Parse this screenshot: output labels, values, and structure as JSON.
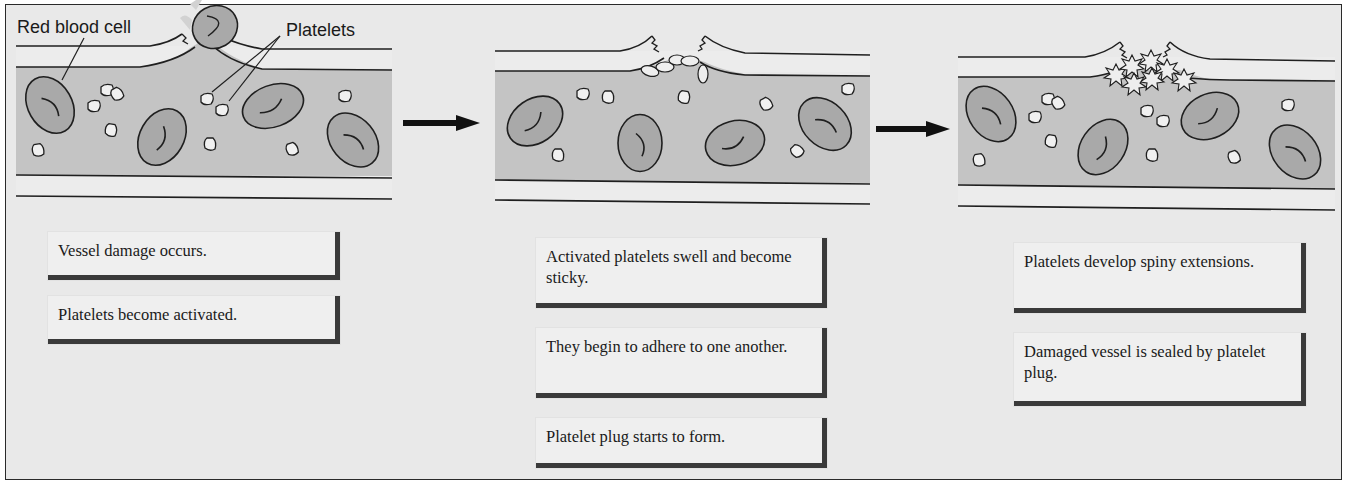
{
  "diagram": {
    "labels": {
      "red_blood_cell": "Red blood cell",
      "platelets": "Platelets"
    },
    "stages": [
      {
        "id": "stage-1",
        "boxes": [
          "Vessel damage occurs.",
          "Platelets become activated."
        ]
      },
      {
        "id": "stage-2",
        "boxes": [
          "Activated platelets swell and become sticky.",
          "They begin to adhere to one another.",
          "Platelet plug starts to form."
        ]
      },
      {
        "id": "stage-3",
        "boxes": [
          "Platelets develop spiny extensions.",
          "Damaged vessel is sealed by platelet plug."
        ]
      }
    ],
    "arrows": [
      "stage-1 to stage-2",
      "stage-2 to stage-3"
    ],
    "colors": {
      "background": "#e9e9e9",
      "vessel_lumen": "#c4c4c4",
      "vessel_wall": "#ececec",
      "cell_fill": "#a9a9a9",
      "outline": "#1f1f1f",
      "box_shadow": "#3a3a3a"
    }
  }
}
